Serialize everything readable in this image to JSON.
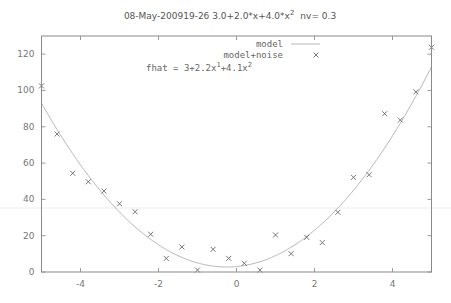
{
  "chart_data": {
    "type": "scatter",
    "title": "08-May-200919-26 3.0+2.0*x+4.0*x",
    "title_superscript": "2",
    "title_suffix": "nv= 0.3",
    "xlabel": "",
    "ylabel": "",
    "xlim": [
      -5,
      5
    ],
    "ylim": [
      0,
      130
    ],
    "xticks": [
      -4,
      -2,
      0,
      2,
      4
    ],
    "xtick_labels": [
      "-4",
      "-2",
      "0",
      "2",
      "4"
    ],
    "yticks": [
      0,
      20,
      40,
      60,
      80,
      100,
      120
    ],
    "ytick_labels": [
      "0",
      "20",
      "40",
      "60",
      "80",
      "100",
      "120"
    ],
    "grid": false,
    "legend_position": "top-right",
    "legend": [
      {
        "label": "model",
        "style": "line"
      },
      {
        "label": "model+noise",
        "style": "x-marker"
      }
    ],
    "annotation": {
      "prefix": "fhat = 3+2.2x",
      "sup1": "1",
      "mid": "+4.1x",
      "sup2": "2"
    },
    "series": [
      {
        "name": "model",
        "type": "line",
        "equation": "3 + 2*x + 4*x^2",
        "coefficients": [
          3.0,
          2.0,
          4.0
        ]
      },
      {
        "name": "model+noise",
        "type": "scatter",
        "x": [
          -5.0,
          -4.6,
          -4.2,
          -3.8,
          -3.4,
          -3.0,
          -2.6,
          -2.2,
          -1.8,
          -1.4,
          -1.0,
          -0.6,
          -0.2,
          0.2,
          0.6,
          1.0,
          1.4,
          1.8,
          2.2,
          2.6,
          3.0,
          3.4,
          3.8,
          4.2,
          4.6,
          5.0
        ],
        "y": [
          102.5,
          76.0,
          54.4,
          49.7,
          44.6,
          37.6,
          33.2,
          20.8,
          7.5,
          13.8,
          1.1,
          12.5,
          7.5,
          4.8,
          1.1,
          20.4,
          10.1,
          19.1,
          16.2,
          32.9,
          52.1,
          53.6,
          87.2,
          83.7,
          99.2,
          123.8
        ]
      }
    ]
  }
}
